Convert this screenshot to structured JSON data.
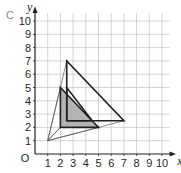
{
  "part_label": "c",
  "axes": {
    "x_label": "x",
    "y_label": "y",
    "origin_label": "O",
    "x_ticks": [
      "1",
      "2",
      "3",
      "4",
      "5",
      "6",
      "7",
      "8",
      "9",
      "10"
    ],
    "y_ticks": [
      "1",
      "2",
      "3",
      "4",
      "5",
      "6",
      "7",
      "8",
      "9",
      "10"
    ]
  },
  "shapes": {
    "object_triangle": {
      "vertices": [
        [
          2,
          5
        ],
        [
          2,
          2
        ],
        [
          5,
          2
        ]
      ],
      "fill": "#b3b3b3"
    },
    "image_triangle": {
      "vertices": [
        [
          2.5,
          7
        ],
        [
          2.5,
          2.5
        ],
        [
          7,
          2.5
        ]
      ]
    },
    "small_triangle": {
      "vertices": [
        [
          2.5,
          5
        ],
        [
          2.5,
          2.5
        ],
        [
          4.5,
          2.5
        ]
      ]
    },
    "centre": [
      1,
      1
    ]
  },
  "colors": {
    "grid": "#c8c8c8",
    "line": "#231f20",
    "shade": "#b3b3b3"
  }
}
